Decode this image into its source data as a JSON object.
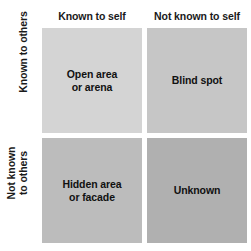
{
  "diagram": {
    "background_color": "#ffffff",
    "text_color": "#111111"
  },
  "columns": [
    {
      "id": "known-self",
      "label": "Known to self"
    },
    {
      "id": "notknown-self",
      "label": "Not known to self"
    }
  ],
  "rows": [
    {
      "id": "known-others",
      "lines": [
        "Known to others"
      ]
    },
    {
      "id": "notknown-others",
      "lines": [
        "Not known",
        "to others"
      ]
    }
  ],
  "quadrants": [
    {
      "id": "open-area",
      "row": "known-others",
      "column": "known-self",
      "lines": [
        "Open area",
        "or arena"
      ],
      "fill": "#d4d4d4"
    },
    {
      "id": "blind-spot",
      "row": "known-others",
      "column": "notknown-self",
      "lines": [
        "Blind spot"
      ],
      "fill": "#c6c6c6"
    },
    {
      "id": "hidden-area",
      "row": "notknown-others",
      "column": "known-self",
      "lines": [
        "Hidden area",
        "or facade"
      ],
      "fill": "#bcbcbc"
    },
    {
      "id": "unknown",
      "row": "notknown-others",
      "column": "notknown-self",
      "lines": [
        "Unknown"
      ],
      "fill": "#b0b0b0"
    }
  ]
}
